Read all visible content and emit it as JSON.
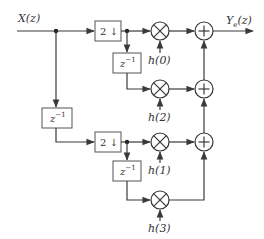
{
  "diagram": {
    "input_label": "X(z)",
    "output_label_main": "Y",
    "output_label_sub": "e",
    "output_label_rest": "(z)",
    "decimator_label": "2 ↓",
    "delay_label_base": "z",
    "delay_label_exp": "−1",
    "multipliers": [
      {
        "id": "m0",
        "coef": "h(0)"
      },
      {
        "id": "m2",
        "coef": "h(2)"
      },
      {
        "id": "m1",
        "coef": "h(1)"
      },
      {
        "id": "m3",
        "coef": "h(3)"
      }
    ],
    "adder_symbol": "+",
    "multiplier_symbol": "×",
    "colors": {
      "line": "#3a3a3a",
      "box_border": "#555555",
      "text": "#333333",
      "background": "#ffffff"
    }
  }
}
